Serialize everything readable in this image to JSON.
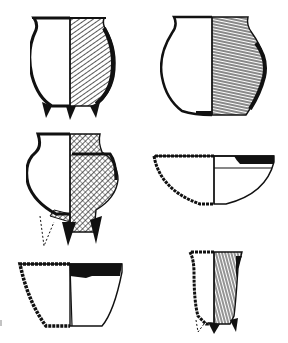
{
  "figure": {
    "type": "archaeological pottery drawing plate",
    "description": "Six ceramic vessels, each drawn with a left half in cross-section and a right half showing the exterior surface",
    "colors": {
      "ink": "#111111",
      "paper": "#ffffff"
    },
    "vessels": [
      {
        "id": 1,
        "position": "top-left",
        "form": "tripod globular jar",
        "exterior": "diagonal brushed/striated texture",
        "feet": 3
      },
      {
        "id": 2,
        "position": "top-right",
        "form": "globular jar with flat base",
        "exterior": "horizontal striations with dark shading"
      },
      {
        "id": 3,
        "position": "middle-left",
        "form": "tripod jar with lugged shoulder",
        "exterior": "cross-hatched texture",
        "feet": 3,
        "reconstructed_foot": "dotted outline"
      },
      {
        "id": 4,
        "position": "middle-right",
        "form": "shallow hemispherical bowl",
        "exterior": "plain with dark painted rim band"
      },
      {
        "id": 5,
        "position": "bottom-left",
        "form": "conical bowl with flat base",
        "exterior": "plain with dark painted rim band"
      },
      {
        "id": 6,
        "position": "bottom-right",
        "form": "tall tripod cup",
        "exterior": "vertical striations",
        "feet": 3
      }
    ]
  }
}
